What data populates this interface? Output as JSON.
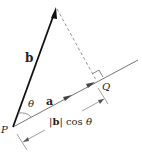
{
  "diagram": {
    "colors": {
      "vector_b": "#111111",
      "line_a": "#555555",
      "arrow_a": "#333333",
      "dashed": "#666666",
      "dimension": "#555555",
      "text": "#222222"
    },
    "labels": {
      "vector_b": "b",
      "vector_a": "a",
      "angle": "θ",
      "point_P": "P",
      "point_Q": "Q",
      "dim_bars_left": "|",
      "dim_b": "b",
      "dim_bars_right": "|",
      "dim_cos": " cos ",
      "dim_theta": "θ"
    },
    "points": {
      "P": [
        13,
        127
      ],
      "b_tip": [
        56,
        7
      ],
      "Q": [
        97,
        80
      ],
      "a_line_end": [
        138,
        60
      ]
    },
    "elements": [
      "vector b (bold arrow from P)",
      "line through a (thin arrow, arrowheads at midpoint and at Q)",
      "dashed perpendicular from tip of b to Q",
      "right-angle marker at Q",
      "angle arc θ at P",
      "dimension line labeled |b| cos θ"
    ]
  }
}
